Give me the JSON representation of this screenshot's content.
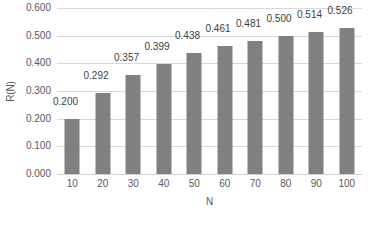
{
  "chart_data": {
    "type": "bar",
    "title": "",
    "subtitle": "",
    "xlabel": "N",
    "ylabel": "R(N)",
    "categories": [
      "10",
      "20",
      "30",
      "40",
      "50",
      "60",
      "70",
      "80",
      "90",
      "100"
    ],
    "values": [
      0.2,
      0.292,
      0.357,
      0.399,
      0.438,
      0.461,
      0.481,
      0.5,
      0.514,
      0.526
    ],
    "data_labels": [
      "0.200",
      "0.292",
      "0.357",
      "0.399",
      "0.438",
      "0.461",
      "0.481",
      "0.500",
      "0.514",
      "0.526"
    ],
    "ylim": [
      0.0,
      0.6
    ],
    "ytick_values": [
      0.0,
      0.1,
      0.2,
      0.3,
      0.4,
      0.5,
      0.6
    ],
    "ytick_labels": [
      "0.000",
      "0.100",
      "0.200",
      "0.300",
      "0.400",
      "0.500",
      "0.600"
    ],
    "grid": true,
    "grid_axis": "y",
    "legend": false,
    "legend_position": "none",
    "series": [
      {
        "name": "R(N)",
        "values": [
          0.2,
          0.292,
          0.357,
          0.399,
          0.438,
          0.461,
          0.481,
          0.5,
          0.514,
          0.526
        ]
      }
    ]
  },
  "style": {
    "bar_color": "#808080",
    "gridline_color": "#d9d9d9",
    "axis_text_color": "#595959",
    "data_label_color": "#404040",
    "background_color": "#ffffff"
  }
}
